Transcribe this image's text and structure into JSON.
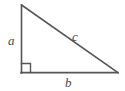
{
  "figure": {
    "type": "right-triangle-diagram",
    "background_color": "#ffffff",
    "stroke_color": "#555555",
    "text_color": "#4a4a4a",
    "stroke_width": 1.6,
    "vertices": {
      "apex": {
        "x": 21,
        "y": 5
      },
      "right_angle_corner": {
        "x": 21,
        "y": 73
      },
      "bottom_right": {
        "x": 118,
        "y": 73
      }
    },
    "right_angle_marker": {
      "name": "right-angle-square",
      "x": 21,
      "y": 63,
      "size": 9,
      "shown": true
    },
    "labels": {
      "leg_vertical": "a",
      "leg_horizontal": "b",
      "hypotenuse": "c"
    },
    "edges": [
      {
        "name": "vertical-leg",
        "label": "a",
        "from": "apex",
        "to": "right_angle_corner"
      },
      {
        "name": "horizontal-leg",
        "label": "b",
        "from": "right_angle_corner",
        "to": "bottom_right"
      },
      {
        "name": "hypotenuse",
        "label": "c",
        "from": "apex",
        "to": "bottom_right"
      }
    ]
  }
}
